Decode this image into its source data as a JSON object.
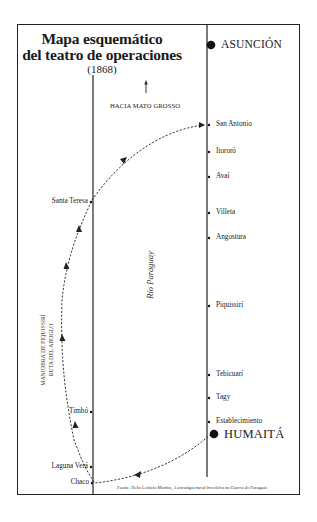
{
  "title": {
    "line1": "Mapa esquemático",
    "line2": "del teatro de operaciones",
    "year": "(1868)"
  },
  "north_label": "HACIA MATO GROSSO",
  "river_label": "Río Paraguay",
  "route_label": {
    "line1": "MANIOBRA DE PIQUISSIRÍ",
    "line2": "RUTA DEL ABOGLO"
  },
  "capitals": [
    {
      "name": "ASUNCIÓN"
    },
    {
      "name": "HUMAITÁ"
    }
  ],
  "right_bank_points": [
    {
      "name": "San Antonio"
    },
    {
      "name": "Itororó"
    },
    {
      "name": "Avaí"
    },
    {
      "name": "Villeta"
    },
    {
      "name": "Angostura"
    },
    {
      "name": "Piquissirí"
    },
    {
      "name": "Tebicuarí"
    },
    {
      "name": "Tagy"
    },
    {
      "name": "Establecimiento"
    }
  ],
  "left_bank_points": [
    {
      "name": "Santa Teresa"
    },
    {
      "name": "Timbó"
    },
    {
      "name": "Laguna Verá"
    },
    {
      "name": "Chaco"
    }
  ],
  "source": {
    "prefix": "Fuente: Helio Leôncio Martins,",
    "work": "A estratégia naval brasileira na Guerra do Paraguai."
  }
}
